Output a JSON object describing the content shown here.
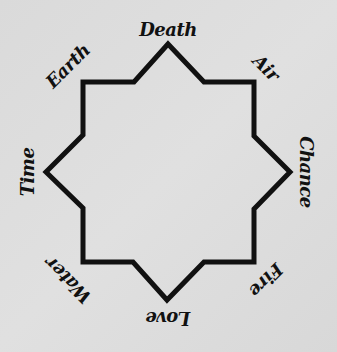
{
  "diagram": {
    "shape": "eight-pointed-star",
    "stroke_color": "#111111",
    "background_color": "#dcdcdc",
    "labels": [
      {
        "text": "Death",
        "x": 168,
        "y": 30,
        "rotate": 0
      },
      {
        "text": "Air",
        "x": 266,
        "y": 68,
        "rotate": 45
      },
      {
        "text": "Chance",
        "x": 306,
        "y": 172,
        "rotate": 90
      },
      {
        "text": "Fire",
        "x": 266,
        "y": 280,
        "rotate": 135
      },
      {
        "text": "Love",
        "x": 168,
        "y": 318,
        "rotate": 180
      },
      {
        "text": "Water",
        "x": 68,
        "y": 280,
        "rotate": -135
      },
      {
        "text": "Time",
        "x": 28,
        "y": 172,
        "rotate": -90
      },
      {
        "text": "Earth",
        "x": 68,
        "y": 66,
        "rotate": -45
      }
    ]
  }
}
